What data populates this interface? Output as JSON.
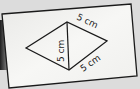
{
  "diagram": {
    "type": "quadrilateral-two-triangles",
    "labels": {
      "top_right_side": "5 cm",
      "diagonal": "5 cm",
      "bottom_right_side": "5 cm"
    },
    "vertices": {
      "left": [
        26,
        48
      ],
      "top": [
        67,
        22
      ],
      "right": [
        107,
        41
      ],
      "bottom": [
        69,
        70
      ]
    },
    "colors": {
      "background": "#dcdcdc",
      "card": "#f4f4f2",
      "stroke": "#1a1a1a",
      "shadow": "#2a2a2a"
    }
  }
}
